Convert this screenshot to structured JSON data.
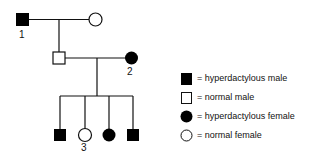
{
  "pedigree": {
    "generation1": [
      {
        "id": "1",
        "sex": "male",
        "affected": true,
        "label": "1"
      },
      {
        "id": "g1f",
        "sex": "female",
        "affected": false,
        "label": ""
      }
    ],
    "generation2": [
      {
        "id": "g2m",
        "sex": "male",
        "affected": false,
        "label": ""
      },
      {
        "id": "2",
        "sex": "female",
        "affected": true,
        "label": "2"
      }
    ],
    "generation3": [
      {
        "id": "c1",
        "sex": "male",
        "affected": true,
        "label": ""
      },
      {
        "id": "3",
        "sex": "female",
        "affected": false,
        "label": "3"
      },
      {
        "id": "c3",
        "sex": "female",
        "affected": true,
        "label": ""
      },
      {
        "id": "c4",
        "sex": "male",
        "affected": true,
        "label": ""
      }
    ]
  },
  "labels": {
    "one": "1",
    "two": "2",
    "three": "3"
  },
  "legend": [
    {
      "symbol": "filled-square",
      "text": "= hyperdactylous male"
    },
    {
      "symbol": "open-square",
      "text": "= normal male"
    },
    {
      "symbol": "filled-circle",
      "text": "= hyperdactylous female"
    },
    {
      "symbol": "open-circle",
      "text": "= normal female"
    }
  ],
  "colors": {
    "line": "#111111",
    "fill": "#000000",
    "background": "#ffffff"
  }
}
